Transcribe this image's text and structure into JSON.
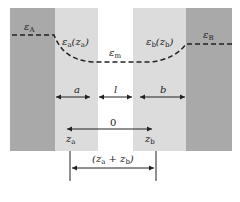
{
  "diagram": {
    "type": "dielectric-layer-schematic",
    "regions": [
      {
        "id": "A",
        "label": "ε_A",
        "shade": "dark",
        "color": "#a9a9a9"
      },
      {
        "id": "a",
        "label": "ε_a(z_a)",
        "shade": "light",
        "color": "#dcdcdc"
      },
      {
        "id": "m",
        "label": "ε_m",
        "shade": "white",
        "color": "#ffffff"
      },
      {
        "id": "b",
        "label": "ε_b(z_b)",
        "shade": "light",
        "color": "#dcdcdc"
      },
      {
        "id": "B",
        "label": "ε_B",
        "shade": "dark",
        "color": "#a9a9a9"
      }
    ],
    "labels": {
      "eps_A": "ε",
      "eps_A_sub": "A",
      "eps_a": "ε",
      "eps_a_sub": "a",
      "eps_a_arg": "(z",
      "eps_a_arg_sub": "a",
      "eps_a_arg_close": ")",
      "eps_m": "ε",
      "eps_m_sub": "m",
      "eps_b": "ε",
      "eps_b_sub": "b",
      "eps_b_arg": "(z",
      "eps_b_arg_sub": "b",
      "eps_b_arg_close": ")",
      "eps_B": "ε",
      "eps_B_sub": "B"
    },
    "dimensions": {
      "a": "a",
      "l": "l",
      "b": "b",
      "origin": "0",
      "za": "z",
      "za_sub": "a",
      "zb": "z",
      "zb_sub": "b",
      "sum_open": "(z",
      "sum_sub_a": "a",
      "sum_plus": " + z",
      "sum_sub_b": "b",
      "sum_close": ")"
    }
  }
}
